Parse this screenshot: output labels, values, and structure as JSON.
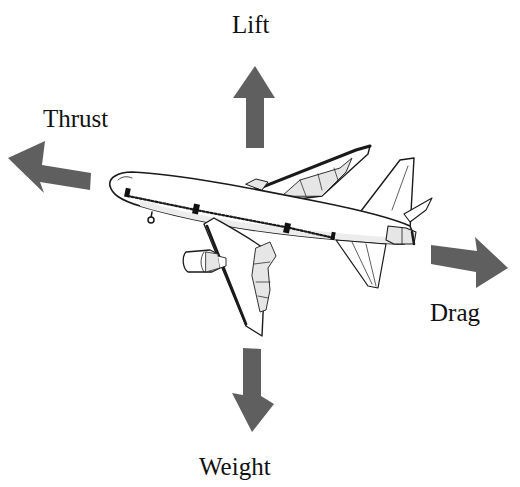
{
  "diagram": {
    "colors": {
      "arrow": "#5f5f5f",
      "outline": "#1a1a1a",
      "fuselage": "#ffffff",
      "shading": "#e6e6e6",
      "background": "#ffffff"
    },
    "forces": [
      {
        "id": "lift",
        "label": "Lift",
        "direction": "up",
        "icon": "arrow-up"
      },
      {
        "id": "thrust",
        "label": "Thrust",
        "direction": "left",
        "icon": "arrow-left"
      },
      {
        "id": "drag",
        "label": "Drag",
        "direction": "right",
        "icon": "arrow-right"
      },
      {
        "id": "weight",
        "label": "Weight",
        "direction": "down",
        "icon": "arrow-down"
      }
    ],
    "center_object": {
      "name": "airplane",
      "icon": "jet-airliner"
    }
  }
}
